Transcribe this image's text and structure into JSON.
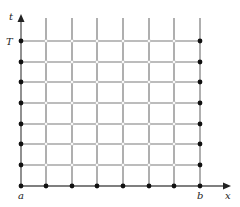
{
  "diagram": {
    "axes": {
      "x_label": "x",
      "t_label": "t",
      "x_start_label": "a",
      "x_end_label": "b",
      "t_end_label": "T"
    },
    "grid": {
      "columns": 8,
      "rows": 8,
      "x_positions": [
        21,
        46,
        72,
        97,
        123,
        149,
        174,
        200
      ],
      "y_positions": [
        41,
        62,
        82,
        103,
        124,
        144,
        165,
        186
      ],
      "line_top": 18
    },
    "points": {
      "boundary_style": "filled",
      "interior_style": "open",
      "boundary_sides": [
        "left",
        "bottom",
        "right"
      ]
    },
    "colors": {
      "line": "#7a7a7a",
      "axis": "#555555",
      "boundary_point": "#111111",
      "interior_point": "#bbbbbb",
      "text": "#222222"
    }
  }
}
